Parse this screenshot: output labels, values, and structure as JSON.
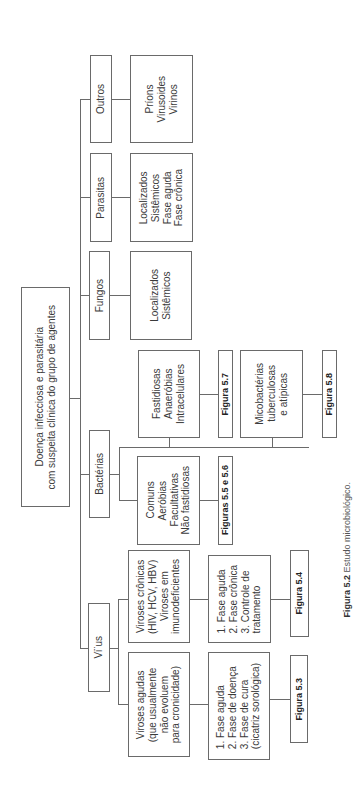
{
  "root": {
    "label": "Doença infecciosa e parasitária\ncom suspeita clínica do grupo de agentes"
  },
  "categories": [
    {
      "label": "Outros",
      "detail": "Príons\nVirusoides\nVirinos"
    },
    {
      "label": "Parasitas",
      "detail": "Localizados\nSistêmicos\nFase aguda\nFase crônica"
    },
    {
      "label": "Fungos",
      "detail": "Localizados\nSistêmicos"
    },
    {
      "label": "Bactérias"
    },
    {
      "label": "Vi¨us"
    }
  ],
  "bacteria": {
    "fastidiosas": {
      "label": "Fastidiosas\nAnaeróbias\nIntracelulares",
      "figure": "Figura 5.7"
    },
    "micobacterias": {
      "label": "Micobactérias\ntuberculosas\ne atípicas",
      "figure": "Figura 5.8"
    },
    "comuns": {
      "label": "Comuns\nAeróbias\nFacultativas\nNão fastidiosas",
      "figure": "Figuras 5.5 e 5.6"
    }
  },
  "virus": {
    "cronicas": {
      "label": "Viroses crônicas\n(HIV, HCV, HBV)\nViroses em\nimunodeficientes",
      "phases": "1. Fase aguda\n2. Fase crônica\n3. Controle de\n    tratamento",
      "figure": "Figura 5.4"
    },
    "agudas": {
      "label": "Viroses agudas\n(que usualmente\nnão evoluem\npara cronicidade)",
      "phases": "1. Fase aguda\n2. Fase de doença\n3. Fase de cura\n    (cicatriz sorológica)",
      "figure": "Figura 5.3"
    }
  },
  "caption": {
    "figure": "Figura 5.2",
    "text": " Estudo microbiológico."
  }
}
